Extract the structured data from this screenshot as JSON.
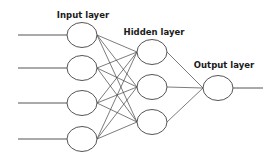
{
  "diagram": {
    "colors": {
      "background": "#ffffff",
      "stroke": "#555555",
      "text": "#1a1a1a"
    },
    "layers": [
      {
        "name": "input",
        "label": "Input layer",
        "label_pos": [
          83,
          18
        ],
        "nodes": [
          [
            82,
            35
          ],
          [
            82,
            68
          ],
          [
            82,
            103
          ],
          [
            82,
            139
          ]
        ]
      },
      {
        "name": "hidden",
        "label": "Hidden layer",
        "label_pos": [
          154,
          35
        ],
        "nodes": [
          [
            152,
            52
          ],
          [
            152,
            87
          ],
          [
            152,
            122
          ]
        ]
      },
      {
        "name": "output",
        "label": "Output layer",
        "label_pos": [
          224,
          68
        ],
        "nodes": [
          [
            218,
            88
          ]
        ]
      }
    ],
    "node_radius": {
      "rx": 15,
      "ry": 12.5
    },
    "input_lines_start_x": 18,
    "output_line_end_x": 263
  }
}
